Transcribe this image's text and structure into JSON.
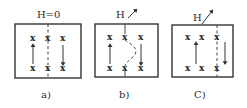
{
  "figure": {
    "panels": [
      {
        "id": "a",
        "field_label": "H=0",
        "field_arrow": false,
        "caption": "a)",
        "marks_top": [
          "x",
          "x",
          "x"
        ],
        "marks_bottom": [
          "x",
          "x",
          "x"
        ],
        "domain_wall": "straight dashed vertical line through middle column",
        "left_domain_arrow": "up",
        "right_domain_arrow": "down"
      },
      {
        "id": "b",
        "field_label": "H",
        "field_arrow": true,
        "caption": "b)",
        "marks_top": [
          "x",
          "x",
          "x"
        ],
        "marks_bottom": [
          "x",
          "x",
          "x"
        ],
        "domain_wall": "curved dashed line bowing to the right",
        "left_domain_arrow": "up",
        "right_domain_arrow": "down"
      },
      {
        "id": "c",
        "field_label": "H",
        "field_arrow": true,
        "caption": "C)",
        "marks_top": [
          "x",
          "x",
          "x"
        ],
        "marks_bottom": [
          "x",
          "x",
          "x"
        ],
        "domain_wall": "straight dashed vertical line moved to right column",
        "left_domain_arrow": "up",
        "right_domain_arrow": "down"
      }
    ]
  }
}
